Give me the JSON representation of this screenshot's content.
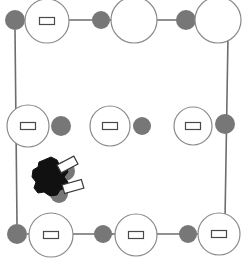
{
  "canvas": {
    "width": 247,
    "height": 260,
    "background": "#ffffff",
    "title": "Node grid with connector edges and agent marker"
  },
  "palette": {
    "edge_stroke": "#6d6d6d",
    "ring_stroke": "#8a8a8a",
    "ring_fill": "#ffffff",
    "node_gray_fill": "#777777",
    "marker_black": "#111111",
    "tag_fill": "#ffffff",
    "tag_stroke": "#4a4a4a"
  },
  "chart_data": {
    "type": "scatter",
    "xlabel": "",
    "ylabel": "",
    "xlim": [
      0,
      247
    ],
    "ylim": [
      0,
      260
    ],
    "grid": false,
    "legend": "none",
    "series": [
      {
        "name": "ring-nodes",
        "marker": "open-circle",
        "points": [
          {
            "id": "ring-top-left",
            "x": 47,
            "y": 21,
            "r": 22,
            "tag": true
          },
          {
            "id": "ring-top-mid",
            "x": 134,
            "y": 20,
            "r": 23,
            "tag": false
          },
          {
            "id": "ring-top-right",
            "x": 218,
            "y": 20,
            "r": 23,
            "tag": false
          },
          {
            "id": "ring-mid-left",
            "x": 28,
            "y": 126,
            "r": 21,
            "tag": true
          },
          {
            "id": "ring-mid-center",
            "x": 110,
            "y": 126,
            "r": 20,
            "tag": true
          },
          {
            "id": "ring-mid-right",
            "x": 193,
            "y": 126,
            "r": 19,
            "tag": true
          },
          {
            "id": "ring-bottom-left",
            "x": 51,
            "y": 235,
            "r": 22,
            "tag": true
          },
          {
            "id": "ring-bottom-mid",
            "x": 136,
            "y": 235,
            "r": 21,
            "tag": true
          },
          {
            "id": "ring-bottom-right",
            "x": 219,
            "y": 234,
            "r": 21,
            "tag": true
          }
        ]
      },
      {
        "name": "gray-nodes",
        "marker": "filled-circle",
        "points": [
          {
            "id": "gray-top-left",
            "x": 15,
            "y": 20,
            "r": 10
          },
          {
            "id": "gray-top-a",
            "x": 101,
            "y": 20,
            "r": 9
          },
          {
            "id": "gray-top-b",
            "x": 186,
            "y": 20,
            "r": 10
          },
          {
            "id": "gray-mid-left",
            "x": 61,
            "y": 126,
            "r": 10
          },
          {
            "id": "gray-mid-center",
            "x": 142,
            "y": 126,
            "r": 9
          },
          {
            "id": "gray-mid-right",
            "x": 225,
            "y": 124,
            "r": 10
          },
          {
            "id": "gray-bottom-left",
            "x": 17,
            "y": 234,
            "r": 10
          },
          {
            "id": "gray-bottom-a",
            "x": 103,
            "y": 234,
            "r": 9
          },
          {
            "id": "gray-bottom-b",
            "x": 188,
            "y": 234,
            "r": 9
          },
          {
            "id": "gray-agent-upper",
            "x": 65,
            "y": 171,
            "r": 10
          },
          {
            "id": "gray-agent-lower",
            "x": 59,
            "y": 194,
            "r": 9
          }
        ]
      }
    ],
    "edges": [
      {
        "id": "edge-top-1",
        "x1": 25,
        "y1": 20,
        "x2": 111,
        "y2": 20
      },
      {
        "id": "edge-top-2",
        "x1": 110,
        "y1": 20,
        "x2": 196,
        "y2": 20
      },
      {
        "id": "edge-left",
        "x1": 15,
        "y1": 30,
        "x2": 17,
        "y2": 224
      },
      {
        "id": "edge-right",
        "x1": 228,
        "y1": 36,
        "x2": 225,
        "y2": 220
      },
      {
        "id": "edge-bottom-1",
        "x1": 27,
        "y1": 234,
        "x2": 113,
        "y2": 234
      },
      {
        "id": "edge-bottom-2",
        "x1": 112,
        "y1": 234,
        "x2": 198,
        "y2": 234
      }
    ],
    "agent_marker": {
      "id": "agent-blob",
      "x": 48,
      "y": 177,
      "width": 34,
      "height": 36,
      "fill": "#111111",
      "tags": [
        {
          "id": "agent-tag-upper",
          "x": 58,
          "y": 160,
          "w": 19,
          "h": 9,
          "rotation": -28
        },
        {
          "id": "agent-tag-lower",
          "x": 63,
          "y": 182,
          "w": 20,
          "h": 9,
          "rotation": -16
        }
      ]
    },
    "tag_shape": {
      "w": 15,
      "h": 7,
      "description": "small white rectangle label inside node"
    }
  }
}
